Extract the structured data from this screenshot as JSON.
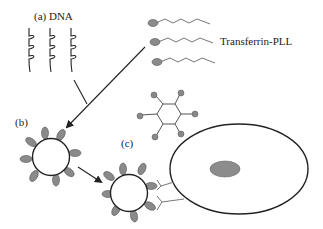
{
  "labels": {
    "a": "(a) DNA",
    "b": "(b)",
    "c": "(c)",
    "transferrin": "Transferrin-PLL"
  },
  "colors": {
    "stroke": "#222222",
    "ligand_fill": "#8a8a8a",
    "nucleus_fill": "#8c8c8c",
    "receptor": "#777777"
  },
  "components": [
    {
      "id": "dna-strands",
      "count": 3
    },
    {
      "id": "transferrin-pll-chains",
      "count": 3
    },
    {
      "id": "hexagon-molecule"
    },
    {
      "id": "complex-b",
      "ligands": 8
    },
    {
      "id": "complex-c",
      "ligands": 8
    },
    {
      "id": "cell",
      "has_nucleus": true,
      "receptors": 2
    }
  ]
}
